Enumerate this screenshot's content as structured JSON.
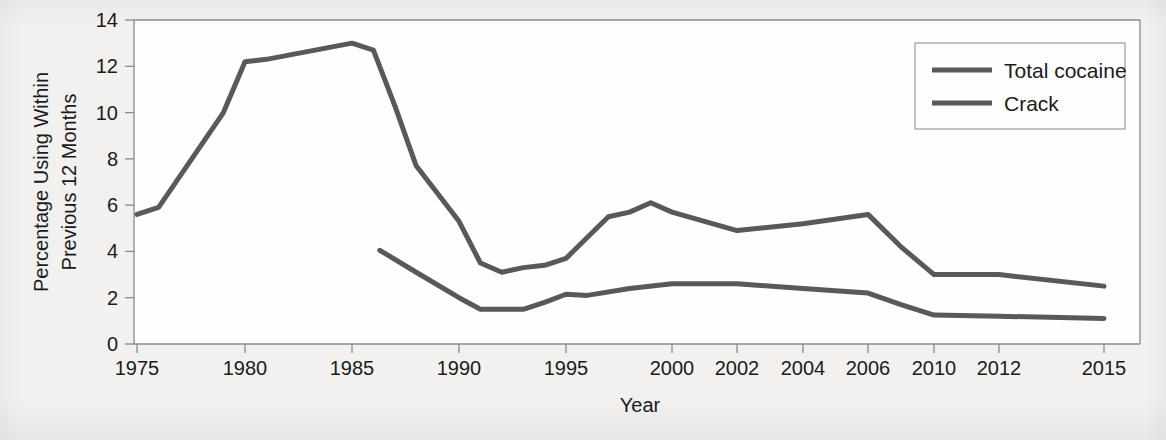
{
  "chart_data": {
    "type": "line",
    "title": "",
    "xlabel": "Year",
    "ylabel": "Percentage Using Within Previous 12 Months",
    "ylabel_line1": "Percentage Using Within",
    "ylabel_line2": "Previous 12 Months",
    "ylim": [
      0,
      14
    ],
    "ytick_labels": [
      "0",
      "2",
      "4",
      "6",
      "8",
      "10",
      "12",
      "14"
    ],
    "ytick_values": [
      0,
      2,
      4,
      6,
      8,
      10,
      12,
      14
    ],
    "xtick_labels": [
      "1975",
      "1980",
      "1985",
      "1990",
      "1995",
      "2000",
      "2002",
      "2004",
      "2006",
      "2010",
      "2012",
      "2015"
    ],
    "xtick_values": [
      1975,
      1980,
      1985,
      1990,
      1995,
      2000,
      2002,
      2004,
      2006,
      2010,
      2012,
      2015
    ],
    "grid": false,
    "legend_position": "top-right",
    "series": [
      {
        "name": "Total cocaine",
        "color": "#595959",
        "x": [
          1975,
          1976,
          1979,
          1980,
          1981,
          1985,
          1986,
          1987,
          1988,
          1990,
          1991,
          1992,
          1993,
          1994,
          1995,
          1996,
          1997,
          1998,
          1999,
          2000,
          2002,
          2004,
          2006,
          2008,
          2010,
          2012,
          2015
        ],
        "values": [
          5.6,
          5.9,
          10.0,
          12.2,
          12.3,
          13.0,
          12.7,
          10.3,
          7.7,
          5.3,
          3.5,
          3.1,
          3.3,
          3.4,
          3.7,
          4.6,
          5.5,
          5.7,
          6.1,
          5.7,
          4.9,
          5.2,
          5.6,
          4.2,
          3.0,
          3.0,
          2.5
        ]
      },
      {
        "name": "Crack",
        "color": "#595959",
        "x": [
          1986.3,
          1988,
          1990,
          1991,
          1992,
          1993,
          1994,
          1995,
          1996,
          1998,
          2000,
          2002,
          2004,
          2006,
          2008,
          2010,
          2012,
          2015
        ],
        "values": [
          4.05,
          3.1,
          2.0,
          1.5,
          1.5,
          1.5,
          1.8,
          2.15,
          2.1,
          2.4,
          2.6,
          2.6,
          2.4,
          2.2,
          1.7,
          1.25,
          1.2,
          1.1
        ]
      }
    ]
  },
  "legend": {
    "items": [
      {
        "label": "Total cocaine"
      },
      {
        "label": "Crack"
      }
    ]
  },
  "axes": {
    "x_title": "Year",
    "y_title_line1": "Percentage Using Within",
    "y_title_line2": "Previous 12 Months"
  },
  "colors": {
    "line": "#595959",
    "axis": "#8a8a8a",
    "text": "#1b1b1b",
    "plot_background": "#fefefe",
    "page_background": "#f2f1ef"
  }
}
